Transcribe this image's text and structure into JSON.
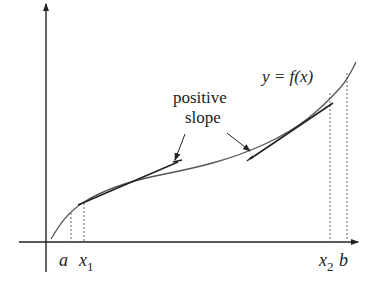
{
  "diagram": {
    "equation_label": "y = f(x)",
    "annotation": {
      "line1": "positive",
      "line2": "slope"
    },
    "x_axis_labels": {
      "a": "a",
      "x1_base": "x",
      "x1_sub": "1",
      "x2_base": "x",
      "x2_sub": "2",
      "b": "b"
    },
    "colors": {
      "curve": "#555555",
      "axis": "#222222",
      "tangent": "#222222",
      "dashed": "#666666"
    }
  }
}
